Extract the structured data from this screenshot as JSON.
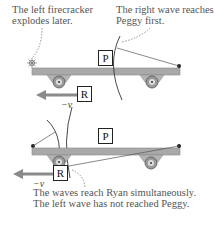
{
  "panel_top": {
    "caption_left": [
      "The left firecracker",
      "explodes later."
    ],
    "caption_right": [
      "The right wave reaches",
      "Peggy first."
    ],
    "peggy_label": "P",
    "ryan_label": "R",
    "velocity_label": "−v"
  },
  "panel_bottom": {
    "peggy_label": "P",
    "ryan_label": "R",
    "velocity_label": "−v",
    "caption": [
      "The waves reach Ryan simultaneously.",
      "The left wave has not reached Peggy."
    ]
  },
  "colors": {
    "platform": "#a9aaa8",
    "arrow": "#8a8a8a",
    "text": "#555555"
  }
}
